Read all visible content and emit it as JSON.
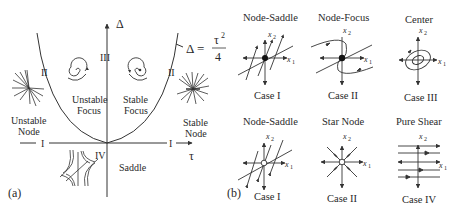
{
  "panel_a": {
    "label": "(a)",
    "axis_y_label": "Δ",
    "axis_x_label": "τ",
    "curve_eq_lhs": "Δ =",
    "curve_eq_num": "τ",
    "curve_eq_exp": "2",
    "curve_eq_den": "4",
    "regions": {
      "unstable_focus_1": "Unstable",
      "unstable_focus_2": "Focus",
      "stable_focus_1": "Stable",
      "stable_focus_2": "Focus",
      "unstable_node_1": "Unstable",
      "unstable_node_2": "Node",
      "stable_node_1": "Stable",
      "stable_node_2": "Node",
      "saddle": "Saddle"
    },
    "case_marks": {
      "left_II": "II",
      "right_II": "II",
      "III": "III",
      "left_I": "I",
      "right_I": "I",
      "IV": "IV"
    }
  },
  "panel_b": {
    "label": "(b)",
    "x1": "x",
    "x1_sub": "1",
    "x2": "x",
    "x2_sub": "2",
    "cells": [
      {
        "title": "Node-Saddle",
        "case": "Case I"
      },
      {
        "title": "Node-Focus",
        "case": "Case II"
      },
      {
        "title": "Center",
        "case": "Case III"
      },
      {
        "title": "Node-Saddle",
        "case": "Case I"
      },
      {
        "title": "Star Node",
        "case": "Case II"
      },
      {
        "title": "Pure Shear",
        "case": "Case IV"
      }
    ]
  }
}
